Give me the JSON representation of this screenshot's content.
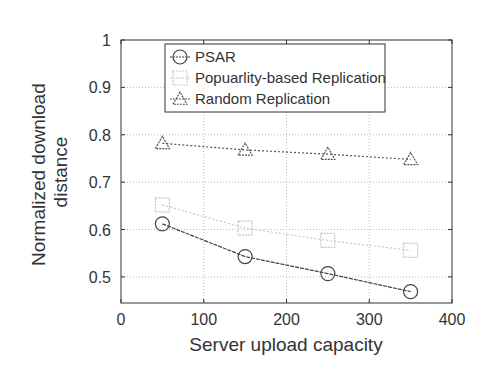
{
  "chart_data": {
    "type": "line",
    "title": "",
    "xlabel": "Server upload capacity",
    "ylabel": "Normalized download distance",
    "ylabel_lines": [
      "Normalized download",
      "distance"
    ],
    "xlim": [
      0,
      400
    ],
    "ylim": [
      0.445,
      1.0
    ],
    "xticks": [
      "0",
      "100",
      "200",
      "300",
      "400"
    ],
    "yticks": [
      "0.5",
      "0.6",
      "0.7",
      "0.8",
      "0.9",
      "1"
    ],
    "grid": true,
    "legend_position": "upper left (inside)",
    "x": [
      50,
      150,
      250,
      350
    ],
    "series": [
      {
        "name": "PSAR",
        "marker": "circle",
        "color": "#444444",
        "values": [
          0.612,
          0.543,
          0.507,
          0.469
        ]
      },
      {
        "name": "Popuarlity-based Replication",
        "marker": "square",
        "color": "#c8c8c8",
        "values": [
          0.652,
          0.603,
          0.577,
          0.556
        ]
      },
      {
        "name": "Random Replication",
        "marker": "triangle",
        "color": "#555555",
        "values": [
          0.782,
          0.768,
          0.759,
          0.748
        ]
      }
    ]
  }
}
